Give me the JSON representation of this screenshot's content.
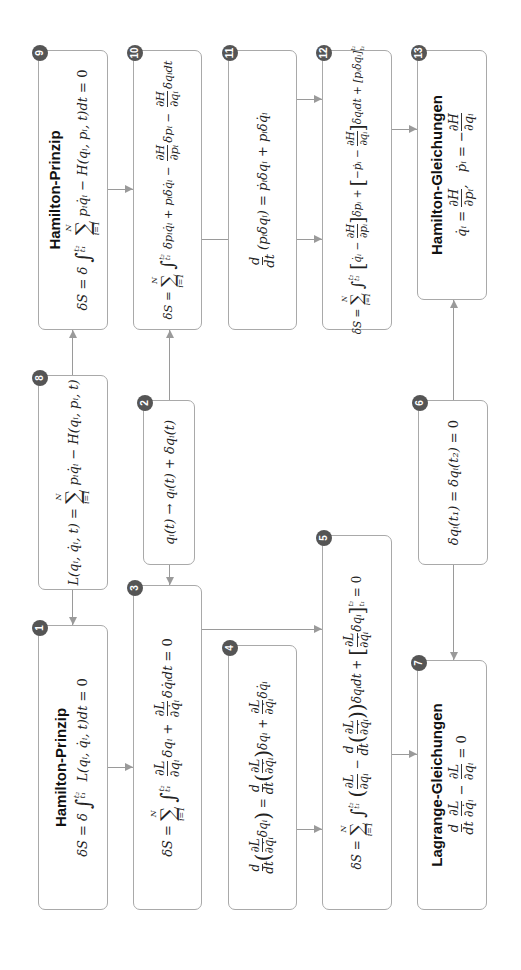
{
  "diagram": {
    "nodes": [
      {
        "id": 1,
        "badge": "1",
        "title": "Hamilton-Prinzip",
        "equation": "δS = δ ∫_{t₁}^{t₂} L(qᵢ, q̇ᵢ, t) dt = 0"
      },
      {
        "id": 2,
        "badge": "2",
        "title": "",
        "equation": "qᵢ(t) → qᵢ(t) + δqᵢ(t)"
      },
      {
        "id": 3,
        "badge": "3",
        "title": "",
        "equation": "δS = Σ_{i=1}^{N} ∫_{t₁}^{t₂} ∂L/∂qᵢ δqᵢ + ∂L/∂q̇ᵢ δq̇ᵢ dt = 0"
      },
      {
        "id": 4,
        "badge": "4",
        "title": "",
        "equation": "d/dt (∂L/∂q̇ᵢ δqᵢ) = d/dt (∂L/∂q̇ᵢ) δqᵢ + ∂L/∂q̇ᵢ δq̇ᵢ"
      },
      {
        "id": 5,
        "badge": "5",
        "title": "",
        "equation": "δS = Σ_{i=1}^{N} ∫_{t₁}^{t₂} (∂L/∂qᵢ − d/dt (∂L/∂q̇ᵢ)) δqᵢ dt + [∂L/∂q̇ᵢ δqᵢ]_{t₁}^{t₂} = 0"
      },
      {
        "id": 6,
        "badge": "6",
        "title": "",
        "equation": "δqᵢ(t₁) = δqᵢ(t₂) = 0"
      },
      {
        "id": 7,
        "badge": "7",
        "title": "Lagrange-Gleichungen",
        "equation": "d/dt ∂L/∂q̇ᵢ − ∂L/∂qᵢ = 0"
      },
      {
        "id": 8,
        "badge": "8",
        "title": "",
        "equation": "L(qᵢ, q̇ᵢ, t) = Σ_{i=1}^{N} pᵢq̇ᵢ − H(qᵢ, pᵢ, t)"
      },
      {
        "id": 9,
        "badge": "9",
        "title": "Hamilton-Prinzip",
        "equation": "δS = δ ∫_{t₁}^{t₂} Σ_{i=1}^{N} pᵢq̇ᵢ − H(qᵢ, pᵢ, t) dt = 0"
      },
      {
        "id": 10,
        "badge": "10",
        "title": "",
        "equation": "δS = Σ_{i=1}^{N} ∫_{t₁}^{t₂} δpᵢq̇ᵢ + pᵢδq̇ᵢ − ∂H/∂pᵢ δpᵢ − ∂H/∂qᵢ δqᵢ dt"
      },
      {
        "id": 11,
        "badge": "11",
        "title": "",
        "equation": "d/dt (pᵢδqᵢ) = ṗᵢδqᵢ + pᵢδq̇ᵢ"
      },
      {
        "id": 12,
        "badge": "12",
        "title": "",
        "equation": "δS = Σ_{i=1}^{N} ∫_{t₁}^{t₂} [q̇ᵢ − ∂H/∂pᵢ] δpᵢ + [−ṗᵢ − ∂H/∂qᵢ] δqᵢ dt + [pᵢδqᵢ]_{t₁}^{t₂}"
      },
      {
        "id": 13,
        "badge": "13",
        "title": "Hamilton-Gleichungen",
        "equation": "q̇ᵢ = ∂H/∂pᵢ,  ṗᵢ = −∂H/∂qᵢ"
      }
    ],
    "labels": {
      "hamilton_prinzip": "Hamilton-Prinzip",
      "lagrange_gleichungen": "Lagrange-Gleichungen",
      "hamilton_gleichungen": "Hamilton-Gleichungen"
    },
    "edges": [
      {
        "from": 8,
        "to": 1
      },
      {
        "from": 8,
        "to": 9
      },
      {
        "from": 1,
        "to": 3
      },
      {
        "from": 2,
        "to": 3
      },
      {
        "from": 2,
        "to": 10
      },
      {
        "from": 9,
        "to": 10
      },
      {
        "from": 3,
        "to": 5
      },
      {
        "from": 4,
        "to": 5
      },
      {
        "from": 10,
        "to": 12
      },
      {
        "from": 11,
        "to": 12
      },
      {
        "from": 5,
        "to": 7
      },
      {
        "from": 6,
        "to": 7
      },
      {
        "from": 6,
        "to": 13
      },
      {
        "from": 12,
        "to": 13
      }
    ],
    "colors": {
      "border": "#a9a9a9",
      "badge": "#555555",
      "arrow": "#9a9a9a",
      "text": "#222222"
    }
  }
}
